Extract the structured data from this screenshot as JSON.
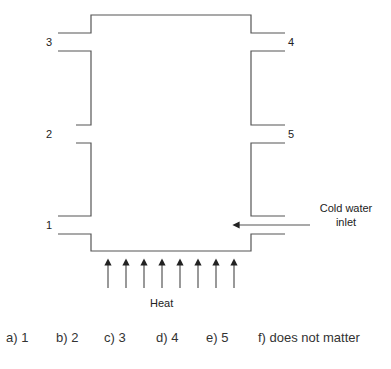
{
  "diagram": {
    "ports": {
      "p1": "1",
      "p2": "2",
      "p3": "3",
      "p4": "4",
      "p5": "5"
    },
    "inlet_label_line1": "Cold water",
    "inlet_label_line2": "inlet",
    "heat_label": "Heat",
    "heat_arrow_count": 8,
    "line_color": "#555555"
  },
  "choices": [
    {
      "label": "a) 1"
    },
    {
      "label": "b) 2"
    },
    {
      "label": "c) 3"
    },
    {
      "label": "d) 4"
    },
    {
      "label": "e) 5"
    },
    {
      "label": "f) does not matter"
    }
  ]
}
